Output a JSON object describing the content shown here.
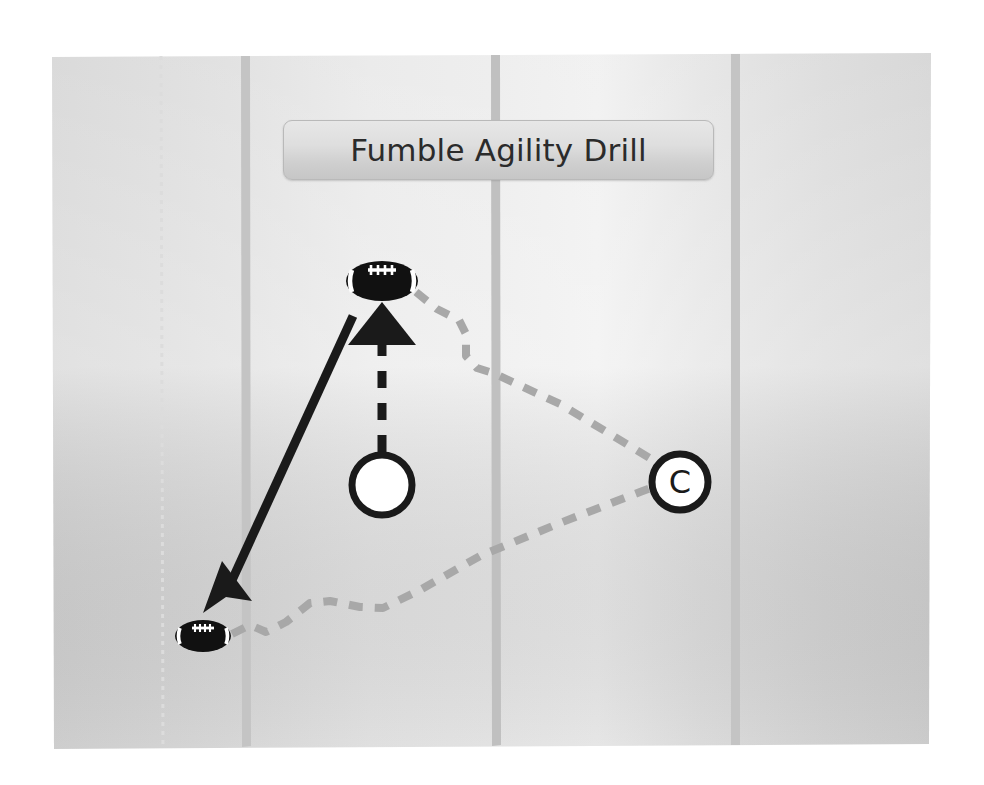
{
  "page": {
    "width": 984,
    "height": 785,
    "background_color": "#ffffff"
  },
  "title": {
    "label": "Fumble Agility Drill",
    "box_fill_top": "#e7e7e7",
    "box_fill_bottom": "#c6c6c6",
    "border_color": "#b9b9b9",
    "text_color": "#2b2b2b"
  },
  "field": {
    "name": "football-field-diagram",
    "fill_light": "#ededed",
    "fill_mid": "#e3e3e3",
    "fill_dark": "#d8d8d8",
    "yard_line_color": "#c2c2c2",
    "yard_line_positions_px": [
      245,
      495,
      735
    ],
    "bounds": {
      "left": 52,
      "top": 53,
      "right": 930,
      "bottom": 748
    }
  },
  "markers": {
    "player": {
      "label": "",
      "name": "player-circle-marker",
      "cx": 382,
      "cy": 485,
      "r": 30,
      "stroke": "#1a1a1a",
      "stroke_width": 7,
      "fill": "#ffffff"
    },
    "coach": {
      "label": "C",
      "name": "coach-circle-marker",
      "cx": 680,
      "cy": 482,
      "r": 28,
      "stroke": "#1a1a1a",
      "stroke_width": 7,
      "fill": "#ffffff",
      "text_color": "#1a1a1a"
    },
    "footballs": [
      {
        "name": "football-top",
        "cx": 382,
        "cy": 281,
        "rx": 36,
        "ry": 20,
        "fill": "#111111",
        "detail": "#ffffff"
      },
      {
        "name": "football-bottom-left",
        "cx": 203,
        "cy": 636,
        "rx": 28,
        "ry": 16,
        "fill": "#111111",
        "detail": "#ffffff"
      }
    ]
  },
  "paths": {
    "dashed_black_arrow": {
      "name": "player-to-ball-dashed-arrow",
      "description": "dashed vertical arrow from player circle up to top football",
      "color": "#1a1a1a",
      "stroke_width": 9,
      "dash": "18 14",
      "from": [
        382,
        452
      ],
      "to": [
        382,
        345
      ],
      "arrowhead_tip": [
        382,
        305
      ]
    },
    "solid_black_arrow": {
      "name": "ball-to-recovery-solid-arrow",
      "description": "solid diagonal arrow from near top football down-left to bottom-left football",
      "color": "#1a1a1a",
      "stroke_width": 9,
      "from": [
        352,
        315
      ],
      "to": [
        225,
        592
      ],
      "arrowhead_tip": [
        205,
        612
      ]
    },
    "gray_dashed_upper": {
      "name": "coach-to-top-ball-dashed-path",
      "description": "gray dashed zigzag path from top football right-down to coach",
      "color": "#a8a8a8",
      "stroke_width": 8,
      "dash": "14 12",
      "points": [
        [
          416,
          292
        ],
        [
          437,
          309
        ],
        [
          459,
          320
        ],
        [
          466,
          334
        ],
        [
          466,
          356
        ],
        [
          477,
          368
        ],
        [
          493,
          373
        ],
        [
          560,
          404
        ],
        [
          630,
          446
        ],
        [
          656,
          462
        ]
      ]
    },
    "gray_dashed_lower": {
      "name": "coach-to-bottom-ball-dashed-path",
      "description": "gray dashed wavy path from bottom-left football up-right to coach",
      "color": "#a8a8a8",
      "stroke_width": 8,
      "dash": "14 12",
      "points": [
        [
          232,
          634
        ],
        [
          250,
          625
        ],
        [
          266,
          632
        ],
        [
          286,
          622
        ],
        [
          310,
          603
        ],
        [
          330,
          601
        ],
        [
          360,
          607
        ],
        [
          383,
          608
        ],
        [
          420,
          590
        ],
        [
          480,
          556
        ],
        [
          560,
          523
        ],
        [
          640,
          492
        ],
        [
          656,
          486
        ]
      ]
    }
  }
}
